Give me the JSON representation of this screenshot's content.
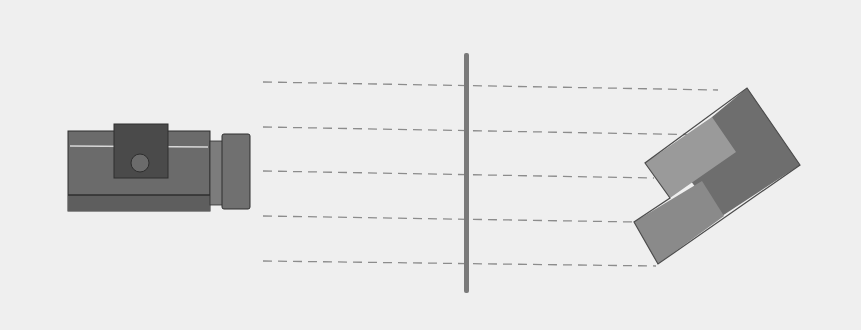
{
  "diagram": {
    "colors": {
      "background": "#efefef",
      "camera_body": "#6b6b6b",
      "camera_body_bottom": "#5e5e5e",
      "camera_top_block": "#4a4a4a",
      "camera_lens": "#707070",
      "camera_lens_neck": "#7c7c7c",
      "camera_stripe": "#d8d8d8",
      "camera_edge": "#2e2e2e",
      "plane": "#7a7a7a",
      "ray": "#8c8c8c",
      "object_light": "#9a9a9a",
      "object_mid": "#8a8a8a",
      "object_dark": "#6e6e6e",
      "object_edge": "#4c4c4c"
    },
    "rays": [
      {
        "x1": 263,
        "y1": 82,
        "x2": 718,
        "y2": 90
      },
      {
        "x1": 263,
        "y1": 127,
        "x2": 712,
        "y2": 135
      },
      {
        "x1": 263,
        "y1": 171,
        "x2": 654,
        "y2": 178
      },
      {
        "x1": 263,
        "y1": 216,
        "x2": 636,
        "y2": 222
      },
      {
        "x1": 263,
        "y1": 261,
        "x2": 656,
        "y2": 266
      }
    ]
  }
}
